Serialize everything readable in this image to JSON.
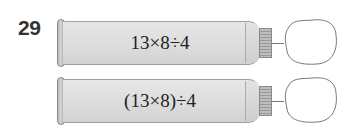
{
  "question": {
    "number": "29"
  },
  "tubes": [
    {
      "expression": "13×8÷4",
      "answer_blank": ""
    },
    {
      "expression": "(13×8)÷4",
      "answer_blank": ""
    }
  ],
  "colors": {
    "tube_fill": "#dcdcdc",
    "outline": "#8a8a8a",
    "text": "#222222"
  }
}
